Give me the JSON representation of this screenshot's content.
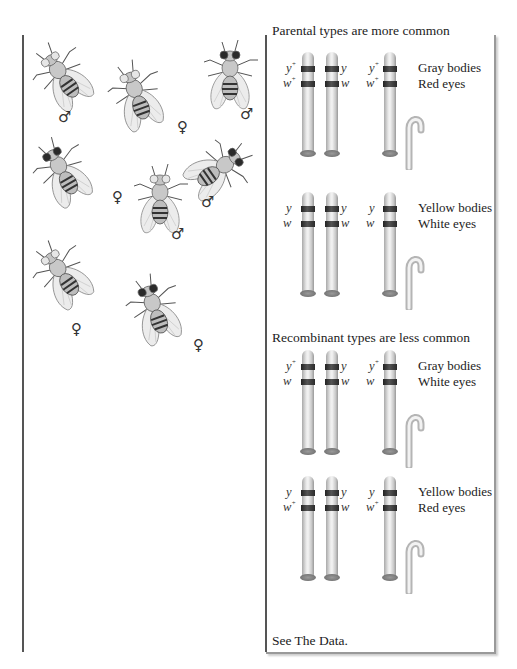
{
  "left_panel": {
    "flies": [
      {
        "id": 1,
        "sex": "male",
        "symbol": "♂",
        "eye": "light",
        "x": 34,
        "y": 38,
        "rot": -35
      },
      {
        "id": 2,
        "sex": "female",
        "symbol": "♀",
        "eye": "light",
        "x": 108,
        "y": 58,
        "rot": -20
      },
      {
        "id": 3,
        "sex": "male",
        "symbol": "♂",
        "eye": "dark",
        "x": 200,
        "y": 38,
        "rot": 0
      },
      {
        "id": 4,
        "sex": "female",
        "symbol": "♀",
        "eye": "dark",
        "x": 34,
        "y": 134,
        "rot": -30
      },
      {
        "id": 5,
        "sex": "male",
        "symbol": "♂",
        "eye": "light",
        "x": 130,
        "y": 162,
        "rot": 0
      },
      {
        "id": 6,
        "sex": "male",
        "symbol": "♂",
        "eye": "dark",
        "x": 186,
        "y": 130,
        "rot": 55
      },
      {
        "id": 7,
        "sex": "female",
        "symbol": "♀",
        "eye": "light",
        "x": 34,
        "y": 236,
        "rot": -35
      },
      {
        "id": 8,
        "sex": "female",
        "symbol": "♀",
        "eye": "dark",
        "x": 126,
        "y": 272,
        "rot": -20
      }
    ],
    "sex_labels": [
      {
        "symbol": "♂",
        "x": 58,
        "y": 110
      },
      {
        "symbol": "♀",
        "x": 177,
        "y": 120
      },
      {
        "symbol": "♂",
        "x": 240,
        "y": 107
      },
      {
        "symbol": "♀",
        "x": 112,
        "y": 190
      },
      {
        "symbol": "♂",
        "x": 171,
        "y": 227
      },
      {
        "symbol": "♂",
        "x": 201,
        "y": 195
      },
      {
        "symbol": "♀",
        "x": 71,
        "y": 322
      },
      {
        "symbol": "♀",
        "x": 193,
        "y": 338
      }
    ]
  },
  "right_panel": {
    "sections": [
      {
        "title": "Parental types are more common",
        "title_y": 23,
        "groups": [
          {
            "top": 52,
            "left_chrom": {
              "upper": "y",
              "upper_sup": "+",
              "lower": "w",
              "lower_sup": "+"
            },
            "right_chrom": {
              "upper": "y",
              "upper_sup": "",
              "lower": "w",
              "lower_sup": ""
            },
            "offspring_chrom": {
              "upper": "y",
              "upper_sup": "+",
              "lower": "w",
              "lower_sup": "+"
            },
            "phenotype": [
              "Gray bodies",
              "Red eyes"
            ]
          },
          {
            "top": 192,
            "left_chrom": {
              "upper": "y",
              "upper_sup": "",
              "lower": "w",
              "lower_sup": ""
            },
            "right_chrom": {
              "upper": "y",
              "upper_sup": "",
              "lower": "w",
              "lower_sup": ""
            },
            "offspring_chrom": {
              "upper": "y",
              "upper_sup": "",
              "lower": "w",
              "lower_sup": ""
            },
            "phenotype": [
              "Yellow bodies",
              "White eyes"
            ]
          }
        ]
      },
      {
        "title": "Recombinant types are less common",
        "title_y": 330,
        "groups": [
          {
            "top": 350,
            "left_chrom": {
              "upper": "y",
              "upper_sup": "+",
              "lower": "w",
              "lower_sup": ""
            },
            "right_chrom": {
              "upper": "y",
              "upper_sup": "",
              "lower": "w",
              "lower_sup": ""
            },
            "offspring_chrom": {
              "upper": "y",
              "upper_sup": "+",
              "lower": "w",
              "lower_sup": ""
            },
            "phenotype": [
              "Gray bodies",
              "White eyes"
            ]
          },
          {
            "top": 476,
            "left_chrom": {
              "upper": "y",
              "upper_sup": "",
              "lower": "w",
              "lower_sup": "+"
            },
            "right_chrom": {
              "upper": "y",
              "upper_sup": "",
              "lower": "w",
              "lower_sup": ""
            },
            "offspring_chrom": {
              "upper": "y",
              "upper_sup": "",
              "lower": "w",
              "lower_sup": "+"
            },
            "phenotype": [
              "Yellow bodies",
              "Red eyes"
            ]
          }
        ]
      }
    ],
    "footer": "See The Data."
  },
  "colors": {
    "line": "#555555",
    "border": "#999999",
    "text": "#222222"
  }
}
